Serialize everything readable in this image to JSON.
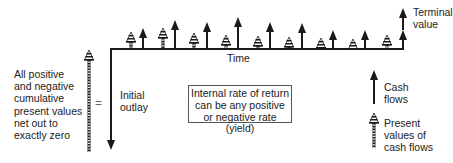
{
  "diagram": {
    "type": "internal-rate-of-return-timeline",
    "left_note": "All positive\nand negative\ncumulative\npresent values\nnet out to\nexactly zero",
    "equals_sign": "=",
    "initial_outlay_label": "Initial\noutlay",
    "time_axis_label": "Time",
    "terminal_value_label": "Terminal\nvalue",
    "irr_box_text": "Internal rate of return\ncan be any positive\nor negative rate (yield)",
    "legend": {
      "cash_flows_label": "Cash\nflows",
      "present_values_label": "Present\nvalues of\ncash flows"
    },
    "timeline": {
      "x_start": 111,
      "x_end": 403,
      "y": 49,
      "initial_outlay_bottom_y": 150,
      "cash_flow_arrows": [
        {
          "x": 143,
          "top_y": 28
        },
        {
          "x": 175,
          "top_y": 20
        },
        {
          "x": 207,
          "top_y": 22
        },
        {
          "x": 238,
          "top_y": 17
        },
        {
          "x": 270,
          "top_y": 22
        },
        {
          "x": 302,
          "top_y": 23
        },
        {
          "x": 333,
          "top_y": 30
        },
        {
          "x": 365,
          "top_y": 30
        },
        {
          "x": 403,
          "top_y": 30,
          "terminal_top_y": 8
        }
      ],
      "present_value_cones": [
        {
          "x": 131,
          "top_y": 32
        },
        {
          "x": 163,
          "top_y": 28
        },
        {
          "x": 194,
          "top_y": 33
        },
        {
          "x": 226,
          "top_y": 35
        },
        {
          "x": 258,
          "top_y": 36
        },
        {
          "x": 289,
          "top_y": 37
        },
        {
          "x": 321,
          "top_y": 38
        },
        {
          "x": 353,
          "top_y": 39
        },
        {
          "x": 387,
          "top_y": 35
        }
      ]
    },
    "colors": {
      "stroke": "#1a1a1a",
      "background": "#ffffff",
      "box_border": "#555555"
    }
  }
}
